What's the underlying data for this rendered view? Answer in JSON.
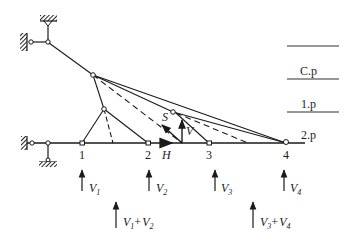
{
  "diagram": {
    "type": "cable-stayed truss force diagram",
    "nodes": [
      {
        "id": "1",
        "label": "1"
      },
      {
        "id": "2",
        "label": "2"
      },
      {
        "id": "3",
        "label": "3"
      },
      {
        "id": "4",
        "label": "4"
      }
    ],
    "member_forces": {
      "S": "S",
      "V": "V",
      "H": "H"
    },
    "reactions": [
      {
        "base": "V",
        "sub": "1"
      },
      {
        "base": "V",
        "sub": "2"
      },
      {
        "base": "V",
        "sub": "3"
      },
      {
        "base": "V",
        "sub": "4"
      }
    ],
    "combined_reactions": [
      {
        "a": "V",
        "a_sub": "1",
        "plus": "+",
        "b": "V",
        "b_sub": "2"
      },
      {
        "a": "V",
        "a_sub": "3",
        "plus": "+",
        "b": "V",
        "b_sub": "4"
      }
    ],
    "level_labels": [
      {
        "label": "C.p"
      },
      {
        "label": "1.p"
      },
      {
        "label": "2.p"
      }
    ],
    "colors": {
      "line": "#1a1a1a",
      "hatch": "#333333",
      "background": "#ffffff"
    }
  }
}
